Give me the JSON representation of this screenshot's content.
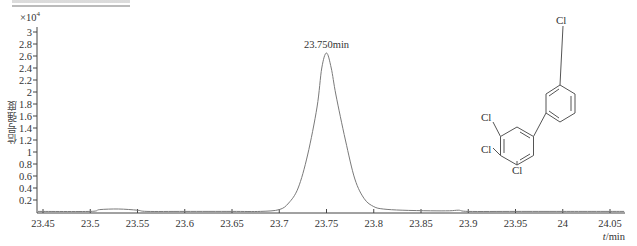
{
  "chart_data": {
    "type": "line",
    "title": "",
    "xlabel": "t/min",
    "ylabel": "信号强度",
    "y_multiplier": "×10⁴",
    "xlim": [
      23.44,
      24.065
    ],
    "ylim": [
      0,
      3.05
    ],
    "x_ticks": [
      "23.45",
      "23.5",
      "23.55",
      "23.6",
      "23.65",
      "23.7",
      "23.75",
      "23.8",
      "23.85",
      "23.9",
      "23.95",
      "24",
      "24.05"
    ],
    "y_ticks": [
      "0.2",
      "0.4",
      "0.6",
      "0.8",
      "1",
      "1.2",
      "1.4",
      "1.6",
      "1.8",
      "2",
      "2.2",
      "2.4",
      "2.6",
      "2.8",
      "3"
    ],
    "grid": false,
    "series": [
      {
        "name": "chromatogram",
        "x": [
          23.44,
          23.5,
          23.51,
          23.53,
          23.55,
          23.56,
          23.6,
          23.65,
          23.68,
          23.7,
          23.71,
          23.72,
          23.73,
          23.74,
          23.745,
          23.75,
          23.755,
          23.76,
          23.77,
          23.78,
          23.79,
          23.8,
          23.81,
          23.83,
          23.86,
          23.88,
          23.89,
          23.9,
          23.95,
          24.0,
          24.065
        ],
        "values": [
          0.01,
          0.01,
          0.04,
          0.05,
          0.03,
          0.01,
          0.01,
          0.01,
          0.01,
          0.04,
          0.15,
          0.4,
          0.95,
          1.75,
          2.4,
          2.65,
          2.4,
          1.95,
          1.2,
          0.55,
          0.22,
          0.09,
          0.05,
          0.03,
          0.02,
          0.02,
          0.03,
          0.01,
          0.01,
          0.01,
          0.01
        ]
      }
    ],
    "annotations": [
      {
        "text": "23.750min",
        "x": 23.75,
        "y": 2.65
      }
    ],
    "inset": {
      "type": "chemical-structure",
      "labels": [
        "Cl",
        "Cl",
        "Cl",
        "Cl"
      ],
      "description": "3,3',4,5-tetrachlorobiphenyl"
    }
  },
  "labels": {
    "ylabel": "信号强度",
    "xlabel": "t/min",
    "multiplier_base": "×10",
    "multiplier_exp": "4",
    "peak": "23.750min",
    "cl": "Cl"
  }
}
